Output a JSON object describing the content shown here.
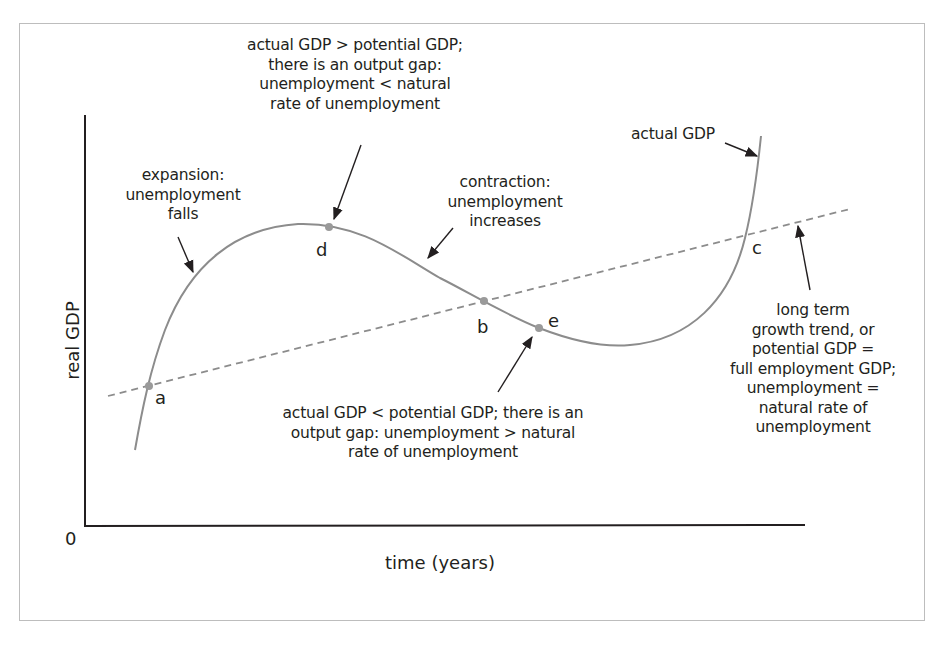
{
  "diagram": {
    "axes": {
      "y_label": "real GDP",
      "x_label": "time (years)",
      "origin": "0"
    },
    "series": [
      {
        "name": "actual GDP",
        "style": "solid",
        "color": "#8c8c8c"
      },
      {
        "name": "long term growth trend (potential GDP)",
        "style": "dashed",
        "color": "#8c8c8c"
      }
    ],
    "points": {
      "a": "a",
      "b": "b",
      "c": "c",
      "d": "d",
      "e": "e"
    },
    "annotations": {
      "top_d": [
        "actual GDP > potential GDP;",
        "there is an output gap:",
        "unemployment < natural",
        "rate of unemployment"
      ],
      "expansion": [
        "expansion:",
        "unemployment",
        "falls"
      ],
      "contraction": [
        "contraction:",
        "unemployment",
        "increases"
      ],
      "actual_gdp": "actual GDP",
      "bottom_e": [
        "actual GDP < potential GDP; there is an",
        "output gap: unemployment > natural",
        "rate of unemployment"
      ],
      "trend": [
        "long term",
        "growth trend, or",
        "potential GDP =",
        "full employment GDP;",
        "unemployment =",
        "natural rate of",
        "unemployment"
      ]
    },
    "colors": {
      "curve": "#8c8c8c",
      "point": "#9a9a9a",
      "axis": "#231f20",
      "text": "#231f20",
      "frame": "#bdbdbd"
    }
  }
}
